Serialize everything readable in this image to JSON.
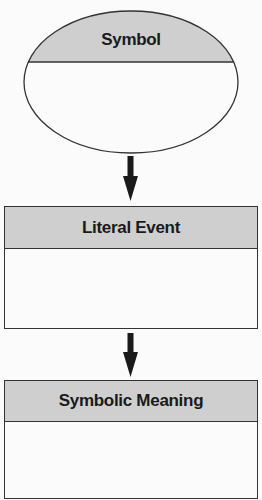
{
  "diagram": {
    "nodes": [
      {
        "id": "symbol",
        "shape": "ellipse",
        "label": "Symbol"
      },
      {
        "id": "literal_event",
        "shape": "rectangle",
        "label": "Literal Event"
      },
      {
        "id": "symbolic_meaning",
        "shape": "rectangle",
        "label": "Symbolic Meaning"
      }
    ],
    "edges": [
      {
        "from": "symbol",
        "to": "literal_event",
        "type": "arrow-down"
      },
      {
        "from": "literal_event",
        "to": "symbolic_meaning",
        "type": "arrow-down"
      }
    ]
  },
  "colors": {
    "header_fill": "#cfcfcf",
    "body_fill": "#fbfbfb",
    "stroke": "#333333",
    "arrow": "#1a1a1a"
  }
}
